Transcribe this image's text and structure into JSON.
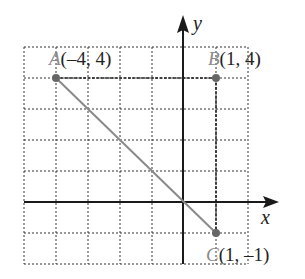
{
  "diagram": {
    "type": "coordinate-plane",
    "grid": {
      "x_min": -5,
      "x_max": 2,
      "y_min": -2,
      "y_max": 5,
      "step": 1,
      "style": "dotted"
    },
    "axes": {
      "x_label": "x",
      "y_label": "y"
    },
    "points": [
      {
        "name": "A",
        "coords": "(–4, 4)",
        "x": -4,
        "y": 4
      },
      {
        "name": "B",
        "coords": "(1, 4)",
        "x": 1,
        "y": 4
      },
      {
        "name": "C",
        "coords": "(1, –1)",
        "x": 1,
        "y": -1
      }
    ],
    "segments": [
      {
        "from": "A",
        "to": "B",
        "style": "dashed-dark"
      },
      {
        "from": "B",
        "to": "C",
        "style": "dashed-dark"
      },
      {
        "from": "A",
        "to": "C",
        "style": "solid-gray"
      }
    ],
    "colors": {
      "axis": "#1a1a1a",
      "grid": "#333333",
      "hypotenuse": "#8a8a8a",
      "point": "#666666",
      "point_label": "#8a8a8a"
    }
  }
}
